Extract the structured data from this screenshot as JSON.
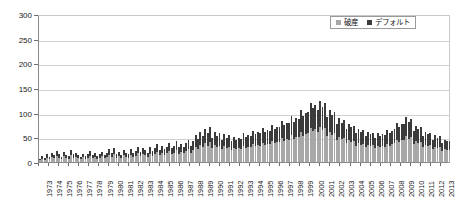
{
  "chart_data": {
    "type": "bar",
    "title": "",
    "subtitle": "",
    "xlabel": "",
    "ylabel": "",
    "stacked": true,
    "grid": true,
    "legend_position": "top-right",
    "ylim": [
      0,
      300
    ],
    "yticks": [
      0,
      50,
      100,
      150,
      200,
      250,
      300
    ],
    "ytick_labels": [
      "0",
      "50",
      "100",
      "150",
      "200",
      "250",
      "300"
    ],
    "xtick_labels": [
      "1973",
      "1974",
      "1975",
      "1976",
      "1977",
      "1978",
      "1979",
      "1980",
      "1981",
      "1982",
      "1983",
      "1984",
      "1985",
      "1986",
      "1987",
      "1988",
      "1989",
      "1990",
      "1991",
      "1992",
      "1993",
      "1994",
      "1995",
      "1996",
      "1997",
      "1998",
      "1999",
      "2000",
      "2001",
      "2002",
      "2003",
      "2004",
      "2005",
      "2006",
      "2007",
      "2008",
      "2009",
      "2010",
      "2011",
      "2012",
      "2013"
    ],
    "x_note": "quarterly bars, 4 per year",
    "series": [
      {
        "name": "破産",
        "color": "#a8a8a8",
        "values": [
          4,
          7,
          5,
          9,
          6,
          11,
          8,
          13,
          9,
          6,
          12,
          8,
          7,
          14,
          9,
          11,
          8,
          6,
          10,
          7,
          9,
          13,
          8,
          11,
          7,
          9,
          12,
          8,
          10,
          15,
          11,
          17,
          9,
          12,
          8,
          14,
          11,
          9,
          15,
          10,
          13,
          18,
          12,
          16,
          14,
          11,
          17,
          13,
          16,
          21,
          14,
          19,
          15,
          18,
          22,
          16,
          19,
          24,
          17,
          21,
          18,
          22,
          26,
          19,
          24,
          31,
          27,
          35,
          30,
          38,
          33,
          41,
          28,
          35,
          30,
          33,
          26,
          32,
          28,
          31,
          24,
          29,
          26,
          28,
          27,
          33,
          29,
          31,
          30,
          36,
          32,
          34,
          33,
          39,
          35,
          37,
          36,
          43,
          38,
          41,
          40,
          48,
          43,
          46,
          45,
          54,
          47,
          51,
          50,
          60,
          53,
          57,
          58,
          68,
          62,
          66,
          60,
          70,
          64,
          68,
          52,
          60,
          55,
          58,
          44,
          51,
          46,
          49,
          38,
          44,
          40,
          42,
          33,
          38,
          35,
          37,
          30,
          35,
          32,
          34,
          28,
          33,
          30,
          32,
          31,
          37,
          33,
          36,
          38,
          45,
          41,
          44,
          44,
          52,
          47,
          50,
          36,
          42,
          38,
          41,
          30,
          35,
          32,
          34,
          26,
          31,
          28,
          30,
          22,
          26,
          24,
          25
        ]
      },
      {
        "name": "デフォルト",
        "color": "#3b3b3b",
        "values": [
          3,
          5,
          4,
          7,
          5,
          8,
          6,
          9,
          7,
          4,
          9,
          6,
          5,
          10,
          7,
          8,
          6,
          4,
          7,
          5,
          7,
          9,
          6,
          8,
          5,
          7,
          9,
          6,
          8,
          11,
          8,
          12,
          7,
          9,
          6,
          10,
          8,
          7,
          11,
          8,
          10,
          13,
          9,
          12,
          11,
          8,
          13,
          10,
          12,
          16,
          11,
          14,
          11,
          13,
          16,
          12,
          14,
          18,
          13,
          16,
          13,
          16,
          19,
          14,
          18,
          23,
          20,
          26,
          22,
          28,
          25,
          31,
          21,
          26,
          22,
          25,
          19,
          24,
          21,
          23,
          18,
          22,
          19,
          21,
          20,
          25,
          22,
          23,
          22,
          27,
          24,
          26,
          25,
          29,
          26,
          28,
          27,
          32,
          28,
          31,
          30,
          36,
          32,
          34,
          34,
          40,
          35,
          38,
          38,
          45,
          40,
          43,
          44,
          51,
          47,
          50,
          46,
          53,
          48,
          52,
          39,
          45,
          41,
          44,
          33,
          38,
          34,
          37,
          28,
          33,
          30,
          31,
          25,
          29,
          26,
          28,
          22,
          26,
          24,
          25,
          21,
          25,
          22,
          24,
          23,
          28,
          25,
          27,
          29,
          34,
          31,
          33,
          33,
          39,
          35,
          38,
          27,
          32,
          29,
          31,
          22,
          26,
          24,
          25,
          19,
          23,
          21,
          22,
          16,
          19,
          18,
          18
        ]
      }
    ]
  },
  "legend": {
    "items": [
      {
        "label": "破産",
        "color": "#a8a8a8"
      },
      {
        "label": "デフォルト",
        "color": "#3b3b3b"
      }
    ]
  },
  "axis": {
    "y_max": 300,
    "y_step": 50
  }
}
